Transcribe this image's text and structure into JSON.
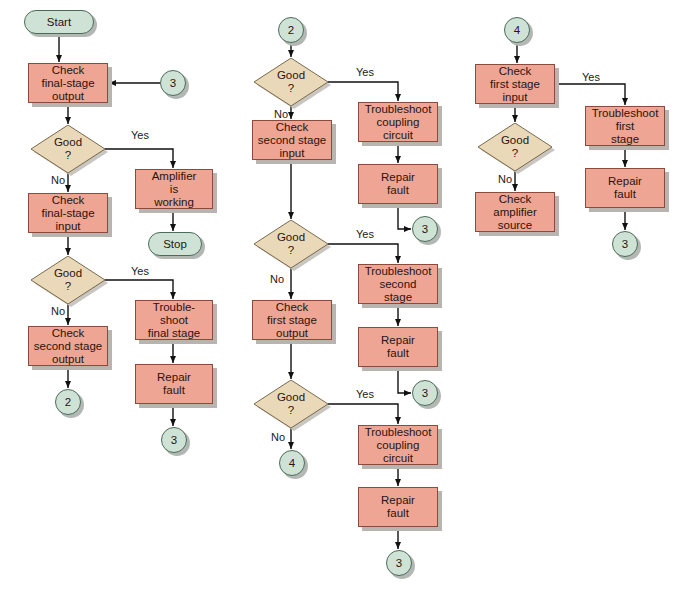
{
  "colors": {
    "process": "#eea594",
    "terminal": "#cfe2d6",
    "decision": "#ead9b8",
    "line": "#111111"
  },
  "nodes": [
    {
      "id": "start",
      "type": "term",
      "text": "Start",
      "x": 24,
      "y": 10,
      "w": 70,
      "h": 24
    },
    {
      "id": "c1_check_out",
      "type": "proc",
      "text": "Check\nfinal-stage\noutput",
      "x": 28,
      "y": 63,
      "w": 80,
      "h": 40
    },
    {
      "id": "c1_conn3_in",
      "type": "conn",
      "text": "3",
      "x": 160,
      "y": 70,
      "w": 26,
      "h": 26
    },
    {
      "id": "c1_dec1",
      "type": "dec",
      "text": "Good\n?",
      "x": 31,
      "y": 125,
      "w": 74,
      "h": 48
    },
    {
      "id": "amp_working",
      "type": "proc",
      "text": "Amplifier\nis\nworking",
      "x": 135,
      "y": 169,
      "w": 78,
      "h": 40
    },
    {
      "id": "stop",
      "type": "term",
      "text": "Stop",
      "x": 148,
      "y": 232,
      "w": 54,
      "h": 24
    },
    {
      "id": "c1_check_in",
      "type": "proc",
      "text": "Check\nfinal-stage\ninput",
      "x": 28,
      "y": 193,
      "w": 80,
      "h": 40
    },
    {
      "id": "c1_dec2",
      "type": "dec",
      "text": "Good\n?",
      "x": 31,
      "y": 256,
      "w": 74,
      "h": 48
    },
    {
      "id": "ts_final",
      "type": "proc",
      "text": "Trouble-\nshoot\nfinal stage",
      "x": 135,
      "y": 300,
      "w": 78,
      "h": 40
    },
    {
      "id": "c1_repair",
      "type": "proc",
      "text": "Repair\nfault",
      "x": 135,
      "y": 364,
      "w": 78,
      "h": 40
    },
    {
      "id": "c1_conn3_out",
      "type": "conn",
      "text": "3",
      "x": 161,
      "y": 427,
      "w": 26,
      "h": 26
    },
    {
      "id": "c1_check_2out",
      "type": "proc",
      "text": "Check\nsecond stage\noutput",
      "x": 28,
      "y": 326,
      "w": 80,
      "h": 40
    },
    {
      "id": "c1_conn2",
      "type": "conn",
      "text": "2",
      "x": 55,
      "y": 389,
      "w": 26,
      "h": 26
    },
    {
      "id": "c2_conn2",
      "type": "conn",
      "text": "2",
      "x": 278,
      "y": 17,
      "w": 26,
      "h": 26
    },
    {
      "id": "c2_dec1",
      "type": "dec",
      "text": "Good\n?",
      "x": 254,
      "y": 58,
      "w": 74,
      "h": 48
    },
    {
      "id": "c2_ts_coup1",
      "type": "proc",
      "text": "Troubleshoot\ncoupling\ncircuit",
      "x": 358,
      "y": 102,
      "w": 80,
      "h": 40
    },
    {
      "id": "c2_repair1",
      "type": "proc",
      "text": "Repair\nfault",
      "x": 358,
      "y": 164,
      "w": 80,
      "h": 40
    },
    {
      "id": "c2_conn3a",
      "type": "conn",
      "text": "3",
      "x": 412,
      "y": 216,
      "w": 26,
      "h": 26
    },
    {
      "id": "c2_check_2in",
      "type": "proc",
      "text": "Check\nsecond stage\ninput",
      "x": 252,
      "y": 120,
      "w": 80,
      "h": 40
    },
    {
      "id": "c2_dec2",
      "type": "dec",
      "text": "Good\n?",
      "x": 254,
      "y": 220,
      "w": 74,
      "h": 48
    },
    {
      "id": "c2_ts_second",
      "type": "proc",
      "text": "Troubleshoot\nsecond\nstage",
      "x": 358,
      "y": 264,
      "w": 80,
      "h": 40
    },
    {
      "id": "c2_repair2",
      "type": "proc",
      "text": "Repair\nfault",
      "x": 358,
      "y": 327,
      "w": 80,
      "h": 40
    },
    {
      "id": "c2_conn3b",
      "type": "conn",
      "text": "3",
      "x": 412,
      "y": 380,
      "w": 26,
      "h": 26
    },
    {
      "id": "c2_check_1out",
      "type": "proc",
      "text": "Check\nfirst  stage\noutput",
      "x": 252,
      "y": 300,
      "w": 80,
      "h": 40
    },
    {
      "id": "c2_dec3",
      "type": "dec",
      "text": "Good\n?",
      "x": 254,
      "y": 380,
      "w": 74,
      "h": 48
    },
    {
      "id": "c2_conn4",
      "type": "conn",
      "text": "4",
      "x": 279,
      "y": 450,
      "w": 26,
      "h": 26
    },
    {
      "id": "c2_ts_coup2",
      "type": "proc",
      "text": "Troubleshoot\ncoupling\ncircuit",
      "x": 358,
      "y": 425,
      "w": 80,
      "h": 40
    },
    {
      "id": "c2_repair3",
      "type": "proc",
      "text": "Repair\nfault",
      "x": 358,
      "y": 487,
      "w": 80,
      "h": 40
    },
    {
      "id": "c2_conn3c",
      "type": "conn",
      "text": "3",
      "x": 386,
      "y": 550,
      "w": 26,
      "h": 26
    },
    {
      "id": "c3_conn4",
      "type": "conn",
      "text": "4",
      "x": 504,
      "y": 17,
      "w": 26,
      "h": 26
    },
    {
      "id": "c3_check_1in",
      "type": "proc",
      "text": "Check\nfirst stage\ninput",
      "x": 475,
      "y": 64,
      "w": 80,
      "h": 40
    },
    {
      "id": "c3_dec",
      "type": "dec",
      "text": "Good\n?",
      "x": 478,
      "y": 123,
      "w": 74,
      "h": 48
    },
    {
      "id": "c3_check_src",
      "type": "proc",
      "text": "Check\namplifier\nsource",
      "x": 475,
      "y": 192,
      "w": 80,
      "h": 40
    },
    {
      "id": "c3_ts_first",
      "type": "proc",
      "text": "Troubleshoot\nfirst\nstage",
      "x": 585,
      "y": 106,
      "w": 80,
      "h": 40
    },
    {
      "id": "c3_repair",
      "type": "proc",
      "text": "Repair\nfault",
      "x": 585,
      "y": 168,
      "w": 80,
      "h": 40
    },
    {
      "id": "c3_conn3",
      "type": "conn",
      "text": "3",
      "x": 612,
      "y": 231,
      "w": 26,
      "h": 26
    }
  ],
  "labels": [
    {
      "text": "Yes",
      "x": 131,
      "y": 129
    },
    {
      "text": "No",
      "x": 51,
      "y": 174
    },
    {
      "text": "Yes",
      "x": 131,
      "y": 265
    },
    {
      "text": "No",
      "x": 51,
      "y": 305
    },
    {
      "text": "Yes",
      "x": 356,
      "y": 66
    },
    {
      "text": "No",
      "x": 274,
      "y": 108
    },
    {
      "text": "Yes",
      "x": 356,
      "y": 228
    },
    {
      "text": "No",
      "x": 270,
      "y": 273
    },
    {
      "text": "Yes",
      "x": 356,
      "y": 388
    },
    {
      "text": "No",
      "x": 271,
      "y": 431
    },
    {
      "text": "Yes",
      "x": 582,
      "y": 71
    },
    {
      "text": "No",
      "x": 498,
      "y": 173
    }
  ]
}
